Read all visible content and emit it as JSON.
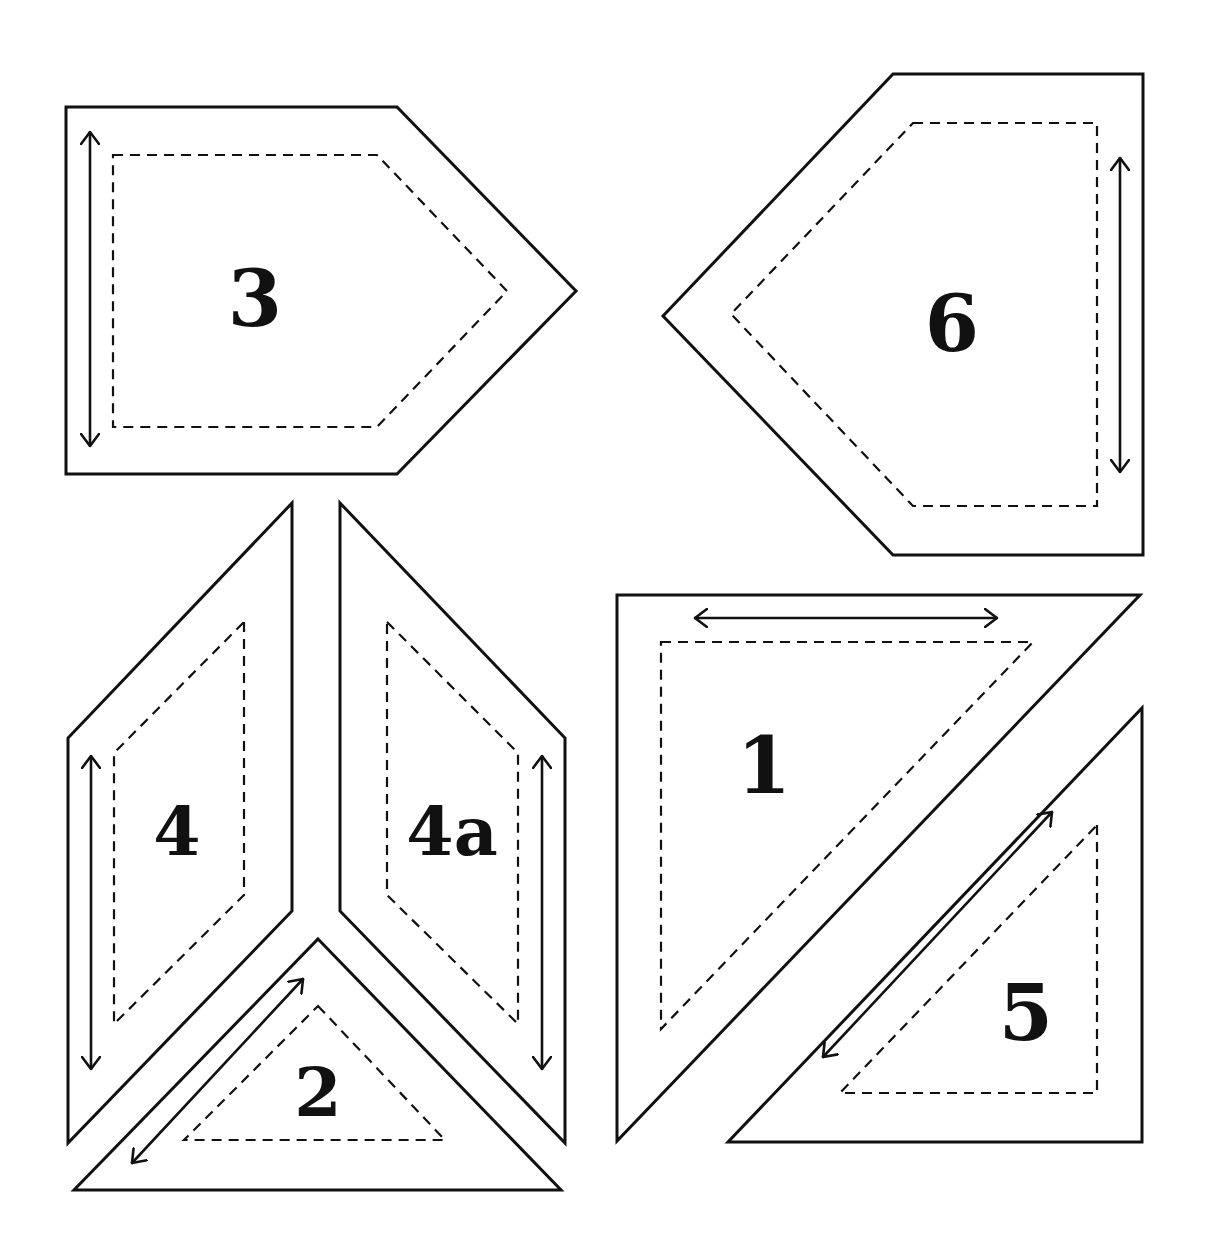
{
  "diagram": {
    "colors": {
      "line": "#111111",
      "background": "#ffffff"
    },
    "pieces": [
      {
        "id": "3",
        "label": "3",
        "shape": "pentagon-point-right",
        "cut_line": [
          [
            66,
            107
          ],
          [
            397,
            107
          ],
          [
            576,
            291
          ],
          [
            397,
            474
          ],
          [
            66,
            474
          ]
        ],
        "sew_line": [
          [
            113,
            155
          ],
          [
            377,
            155
          ],
          [
            507,
            291
          ],
          [
            377,
            427
          ],
          [
            113,
            427
          ]
        ],
        "grain_arrow": [
          [
            90,
            132
          ],
          [
            90,
            446
          ]
        ],
        "label_pos": [
          255,
          298
        ],
        "font_size": 78
      },
      {
        "id": "6",
        "label": "6",
        "shape": "pentagon-point-left",
        "cut_line": [
          [
            893,
            74
          ],
          [
            1143,
            74
          ],
          [
            1143,
            555
          ],
          [
            893,
            555
          ],
          [
            663,
            316
          ]
        ],
        "sew_line": [
          [
            913,
            123
          ],
          [
            1097,
            123
          ],
          [
            1097,
            506
          ],
          [
            913,
            506
          ],
          [
            731,
            314
          ]
        ],
        "grain_arrow": [
          [
            1120,
            158
          ],
          [
            1120,
            472
          ]
        ],
        "label_pos": [
          952,
          323
        ],
        "font_size": 78
      },
      {
        "id": "4",
        "label": "4",
        "shape": "parallelogram-left",
        "cut_line": [
          [
            292,
            503
          ],
          [
            292,
            911
          ],
          [
            68,
            1143
          ],
          [
            68,
            738
          ]
        ],
        "sew_line": [
          [
            244,
            622
          ],
          [
            244,
            895
          ],
          [
            114,
            1024
          ],
          [
            114,
            753
          ]
        ],
        "grain_arrow": [
          [
            91,
            756
          ],
          [
            91,
            1069
          ]
        ],
        "label_pos": [
          177,
          831
        ],
        "font_size": 68
      },
      {
        "id": "4a",
        "label": "4a",
        "shape": "parallelogram-right",
        "cut_line": [
          [
            340,
            503
          ],
          [
            565,
            738
          ],
          [
            565,
            1143
          ],
          [
            340,
            911
          ]
        ],
        "sew_line": [
          [
            387,
            622
          ],
          [
            518,
            753
          ],
          [
            518,
            1024
          ],
          [
            387,
            895
          ]
        ],
        "grain_arrow": [
          [
            542,
            756
          ],
          [
            542,
            1069
          ]
        ],
        "label_pos": [
          452,
          831
        ],
        "font_size": 68
      },
      {
        "id": "2",
        "label": "2",
        "shape": "triangle-isosceles",
        "cut_line": [
          [
            318,
            939
          ],
          [
            561,
            1190
          ],
          [
            74,
            1190
          ]
        ],
        "sew_line": [
          [
            318,
            1006
          ],
          [
            445,
            1140
          ],
          [
            184,
            1140
          ]
        ],
        "grain_arrow": [
          [
            303,
            979
          ],
          [
            132,
            1163
          ]
        ],
        "label_pos": [
          318,
          1092
        ],
        "font_size": 68
      },
      {
        "id": "1",
        "label": "1",
        "shape": "triangle-right-large",
        "cut_line": [
          [
            617,
            595
          ],
          [
            1140,
            595
          ],
          [
            617,
            1141
          ]
        ],
        "sew_line": [
          [
            661,
            642
          ],
          [
            1033,
            642
          ],
          [
            661,
            1029
          ]
        ],
        "grain_arrow": [
          [
            695,
            618
          ],
          [
            997,
            618
          ]
        ],
        "label_pos": [
          764,
          765
        ],
        "font_size": 78
      },
      {
        "id": "5",
        "label": "5",
        "shape": "triangle-right-small",
        "cut_line": [
          [
            1142,
            708
          ],
          [
            1142,
            1142
          ],
          [
            728,
            1142
          ]
        ],
        "sew_line": [
          [
            1097,
            825
          ],
          [
            1097,
            1093
          ],
          [
            840,
            1093
          ]
        ],
        "grain_arrow": [
          [
            1052,
            812
          ],
          [
            823,
            1057
          ]
        ],
        "label_pos": [
          1026,
          1012
        ],
        "font_size": 78
      }
    ]
  }
}
